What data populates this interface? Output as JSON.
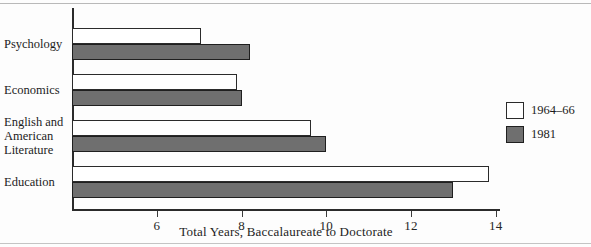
{
  "chart_data": {
    "type": "bar",
    "orientation": "horizontal",
    "title": "",
    "xlabel": "Total Years, Baccalaureate to Doctorate",
    "ylabel": "",
    "xlim": [
      4.0,
      14.1
    ],
    "xticks": [
      6,
      8,
      10,
      12,
      14
    ],
    "xtick_labels": [
      "6",
      "8",
      "10",
      "12",
      "14"
    ],
    "grid": false,
    "legend_position": "right",
    "categories": [
      "Psychology",
      "Economics",
      "English and American Literature",
      "Education"
    ],
    "category_label_lines": [
      [
        "Psychology"
      ],
      [
        "Economics"
      ],
      [
        "English and",
        "American",
        "Literature"
      ],
      [
        "Education"
      ]
    ],
    "series": [
      {
        "name": "1964-66",
        "color": "#ffffff",
        "edge_color": "#2b2b2b",
        "values": [
          7.05,
          7.9,
          9.65,
          13.85
        ]
      },
      {
        "name": "1981",
        "color": "#6f6f6f",
        "edge_color": "#1f1f1f",
        "values": [
          8.2,
          8.0,
          10.0,
          13.0
        ]
      }
    ]
  },
  "legend": {
    "entries": [
      {
        "label": "1964–66",
        "swatch": "light"
      },
      {
        "label": "1981",
        "swatch": "dark"
      }
    ]
  },
  "axis": {
    "x_title": "Total Years, Baccalaureate to Doctorate",
    "tick_labels": [
      "6",
      "8",
      "10",
      "12",
      "14"
    ]
  }
}
